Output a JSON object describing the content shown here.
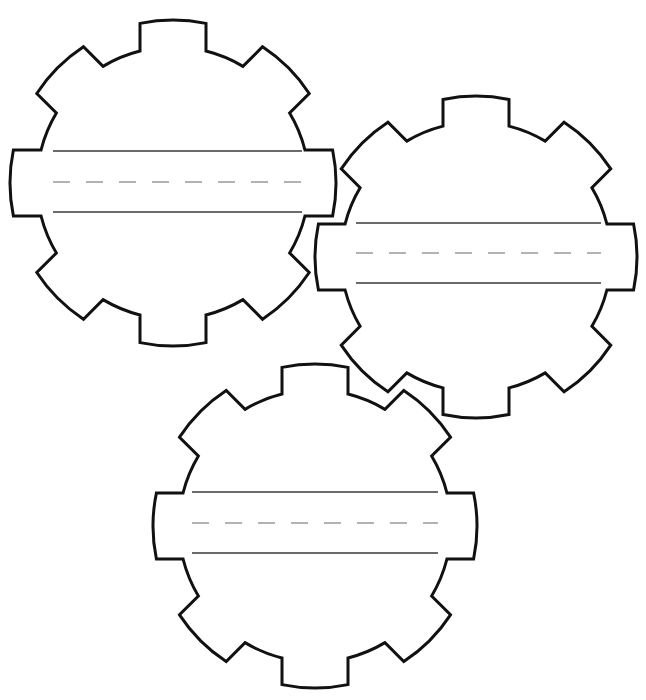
{
  "worksheet": {
    "title": "",
    "gear_count": 3
  },
  "style": {
    "outline_color": "#111111",
    "solid_line_color": "#3a3a3a",
    "dashed_line_color": "#9a9a9a",
    "background": "#ffffff"
  },
  "gears": [
    {
      "id": "gear-top-left",
      "cx": 173,
      "cy": 183,
      "outer_radius": 163,
      "body_radius": 136,
      "tooth_half_width": 33,
      "teeth": 8,
      "writing_lines": {
        "x1": 53,
        "x2": 302,
        "top_y": 151,
        "mid_y": 182,
        "bottom_y": 212
      },
      "text": ""
    },
    {
      "id": "gear-right",
      "cx": 476,
      "cy": 257,
      "outer_radius": 161,
      "body_radius": 135,
      "tooth_half_width": 33,
      "teeth": 8,
      "writing_lines": {
        "x1": 356,
        "x2": 601,
        "top_y": 223,
        "mid_y": 253,
        "bottom_y": 283
      },
      "text": ""
    },
    {
      "id": "gear-bottom",
      "cx": 315,
      "cy": 526,
      "outer_radius": 162,
      "body_radius": 136,
      "tooth_half_width": 33,
      "teeth": 8,
      "writing_lines": {
        "x1": 192,
        "x2": 438,
        "top_y": 492,
        "mid_y": 523,
        "bottom_y": 553
      },
      "text": ""
    }
  ],
  "dash_pattern": {
    "dash": 17,
    "gap": 16
  }
}
